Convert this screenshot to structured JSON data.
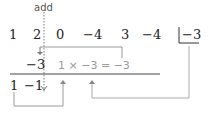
{
  "diagram": {
    "type": "synthetic-division",
    "annotation_label": "add",
    "dividend_row": [
      "1",
      "2",
      "0",
      "−4",
      "3",
      "−4"
    ],
    "divisor": "−3",
    "product_row": [
      "−3"
    ],
    "product_equation": "1 × −3 = −3",
    "result_row": [
      "1",
      "−1"
    ],
    "colors": {
      "text": "#222222",
      "helper_text": "#9a9a9a",
      "helper_lines": "#aaaaaa",
      "rule": "#444444"
    }
  }
}
